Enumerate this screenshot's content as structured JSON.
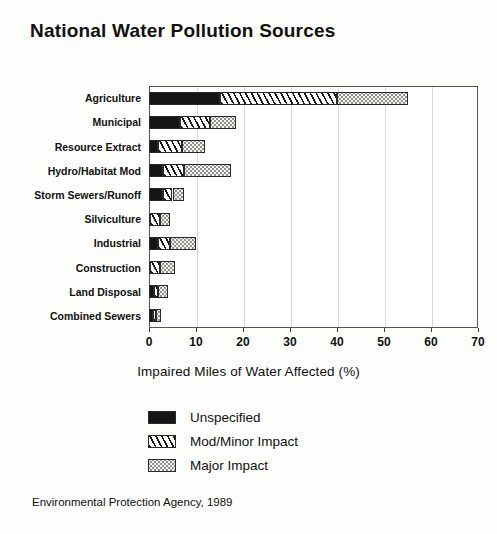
{
  "chart_data": {
    "type": "bar",
    "orientation": "horizontal",
    "stacked": true,
    "title": "National Water Pollution Sources",
    "xlabel": "Impaired Miles of Water Affected (%)",
    "ylabel": "",
    "xlim": [
      0,
      70
    ],
    "xticks": [
      0,
      10,
      20,
      30,
      40,
      50,
      60,
      70
    ],
    "xtick_labels": [
      "0",
      "10",
      "20",
      "30",
      "40",
      "50",
      "60",
      "70"
    ],
    "grid": true,
    "grid_axis": "x",
    "legend_position": "below-axis-label",
    "categories": [
      "Agriculture",
      "Municipal",
      "Resource Extract",
      "Hydro/Habitat Mod",
      "Storm Sewers/Runoff",
      "Silviculture",
      "Industrial",
      "Construction",
      "Land Disposal",
      "Combined Sewers"
    ],
    "series": [
      {
        "name": "Unspecified",
        "color": "#151515",
        "values": [
          15.0,
          6.5,
          2.0,
          3.0,
          3.0,
          0.3,
          2.0,
          0.3,
          1.0,
          0.8
        ]
      },
      {
        "name": "Mod/Minor Impact",
        "color": "#ffffff",
        "values": [
          25.0,
          6.5,
          5.0,
          4.5,
          2.0,
          2.0,
          2.5,
          2.0,
          1.0,
          0.7
        ]
      },
      {
        "name": "Major Impact",
        "color": "#f3f3f0",
        "values": [
          15.0,
          5.5,
          5.0,
          10.0,
          2.5,
          2.2,
          5.5,
          3.2,
          2.0,
          1.0
        ]
      }
    ],
    "totals": [
      55.0,
      18.5,
      12.0,
      17.5,
      7.5,
      4.5,
      10.0,
      5.5,
      4.0,
      2.5
    ],
    "source_note": "Environmental Protection Agency, 1989"
  },
  "legend": {
    "entries": [
      {
        "label": "Unspecified",
        "pattern": "solid-black"
      },
      {
        "label": "Mod/Minor Impact",
        "pattern": "diagonal-hatch"
      },
      {
        "label": "Major Impact",
        "pattern": "light-dots"
      }
    ]
  }
}
